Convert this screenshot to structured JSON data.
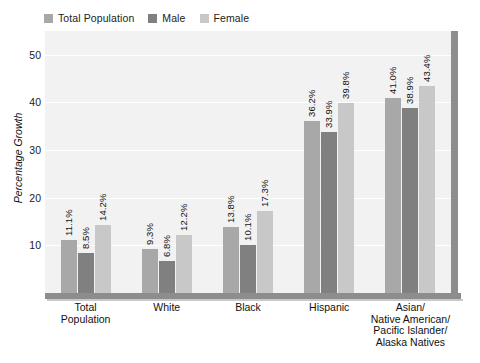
{
  "chart_data": {
    "type": "bar",
    "title": "",
    "subtitle": "",
    "xlabel": "",
    "ylabel": "Percentage Growth",
    "ylim": [
      0,
      55
    ],
    "yticks": [
      10,
      20,
      30,
      40,
      50
    ],
    "grid": true,
    "legend_position": "top-left",
    "categories": [
      "Total\nPopulation",
      "White",
      "Black",
      "Hispanic",
      "Asian/\nNative American/\nPacific Islander/\nAlaska Natives"
    ],
    "category_lines": [
      [
        "Total",
        "Population"
      ],
      [
        "White"
      ],
      [
        "Black"
      ],
      [
        "Hispanic"
      ],
      [
        "Asian/",
        "Native American/",
        "Pacific Islander/",
        "Alaska Natives"
      ]
    ],
    "series": [
      {
        "name": "Total Population",
        "color": "#a8a8a8",
        "values": [
          11.1,
          9.3,
          13.8,
          36.2,
          41.0
        ],
        "labels": [
          "11.1%",
          "9.3%",
          "13.8%",
          "36.2%",
          "41.0%"
        ]
      },
      {
        "name": "Male",
        "color": "#808080",
        "values": [
          8.5,
          6.8,
          10.1,
          33.9,
          38.9
        ],
        "labels": [
          "8.5%",
          "6.8%",
          "10.1%",
          "33.9%",
          "38.9%"
        ]
      },
      {
        "name": "Female",
        "color": "#c8c8c8",
        "values": [
          14.2,
          12.2,
          17.3,
          39.8,
          43.4
        ],
        "labels": [
          "14.2%",
          "12.2%",
          "17.3%",
          "39.8%",
          "43.4%"
        ]
      }
    ]
  },
  "colors": {
    "plot_background": "#f2f2f2",
    "axis_3d": "#8d8d8d",
    "gridline": "#ffffff",
    "text": "#111111"
  }
}
